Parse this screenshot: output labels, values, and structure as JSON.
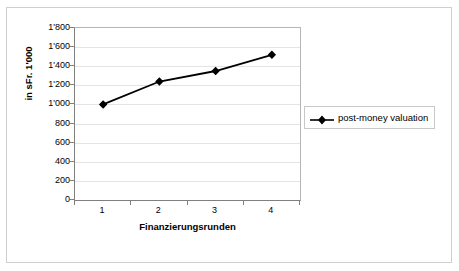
{
  "chart_data": {
    "type": "line",
    "title": "",
    "xlabel": "Finanzierungsrunden",
    "ylabel": "in sFr. 1'000",
    "categories": [
      "1",
      "2",
      "3",
      "4"
    ],
    "x": [
      1,
      2,
      3,
      4
    ],
    "series": [
      {
        "name": "post-money valuation",
        "values": [
          1000,
          1240,
          1350,
          1520
        ],
        "color": "#000000",
        "marker": "diamond"
      }
    ],
    "ylim": [
      0,
      1800
    ],
    "ytick_labels": [
      "0",
      "200",
      "400",
      "600",
      "800",
      "1'000",
      "1'200",
      "1'400",
      "1'600",
      "1'800"
    ],
    "ytick_values": [
      0,
      200,
      400,
      600,
      800,
      1000,
      1200,
      1400,
      1600,
      1800
    ],
    "xtick_labels": [
      "1",
      "2",
      "3",
      "4"
    ],
    "grid": "horizontal",
    "grid_color": "#e4e4e4",
    "legend_position": "right",
    "legend_entries": [
      "post-money valuation"
    ],
    "plot_border_color": "#808080",
    "background": "#ffffff"
  }
}
